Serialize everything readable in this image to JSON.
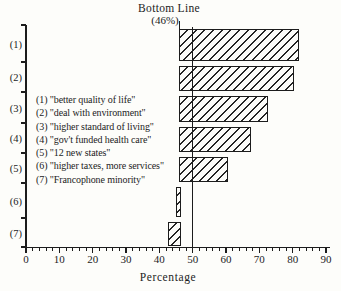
{
  "figure": {
    "title": "Bottom Line",
    "subtitle": "(46%)",
    "xlabel": "Percentage"
  },
  "legend": {
    "items": [
      "(1) \"better quality of life\"",
      "(2) \"deal with environment\"",
      "(3) \"higher standard of living\"",
      "(4) \"gov't funded health care\"",
      "(5) \"12 new states\"",
      "(6) \"higher taxes, more services\"",
      "(7) \"Francophone minority\""
    ]
  },
  "chart_data": {
    "type": "bar",
    "orientation": "horizontal",
    "title": "Bottom Line",
    "subtitle": "(46%)",
    "xlabel": "Percentage",
    "xlim": [
      0,
      90
    ],
    "x_major_ticks": [
      0,
      10,
      20,
      30,
      40,
      50,
      60,
      70,
      80,
      90
    ],
    "x_minor_tick_step": 2,
    "categories": [
      "(1)",
      "(2)",
      "(3)",
      "(4)",
      "(5)",
      "(6)",
      "(7)"
    ],
    "bars": [
      {
        "category": "(1)",
        "label": "better quality of life",
        "from": 46,
        "to": 82
      },
      {
        "category": "(2)",
        "label": "deal with environment",
        "from": 46,
        "to": 80.5
      },
      {
        "category": "(3)",
        "label": "higher standard of living",
        "from": 46,
        "to": 72.5
      },
      {
        "category": "(4)",
        "label": "gov't funded health care",
        "from": 46,
        "to": 67.5
      },
      {
        "category": "(5)",
        "label": "12 new states",
        "from": 46,
        "to": 60.5
      },
      {
        "category": "(6)",
        "label": "higher taxes, more services",
        "from": 45,
        "to": 46.5
      },
      {
        "category": "(7)",
        "label": "Francophone minority",
        "from": 42.5,
        "to": 46.5
      }
    ],
    "bottom_line_pct": 46,
    "reference_line_pct": 50,
    "grid": false,
    "legend_position": "center-left",
    "hatch": "diagonal-forward",
    "ink_color": "#1c1c1c",
    "background_color": "#fdfdfa"
  }
}
